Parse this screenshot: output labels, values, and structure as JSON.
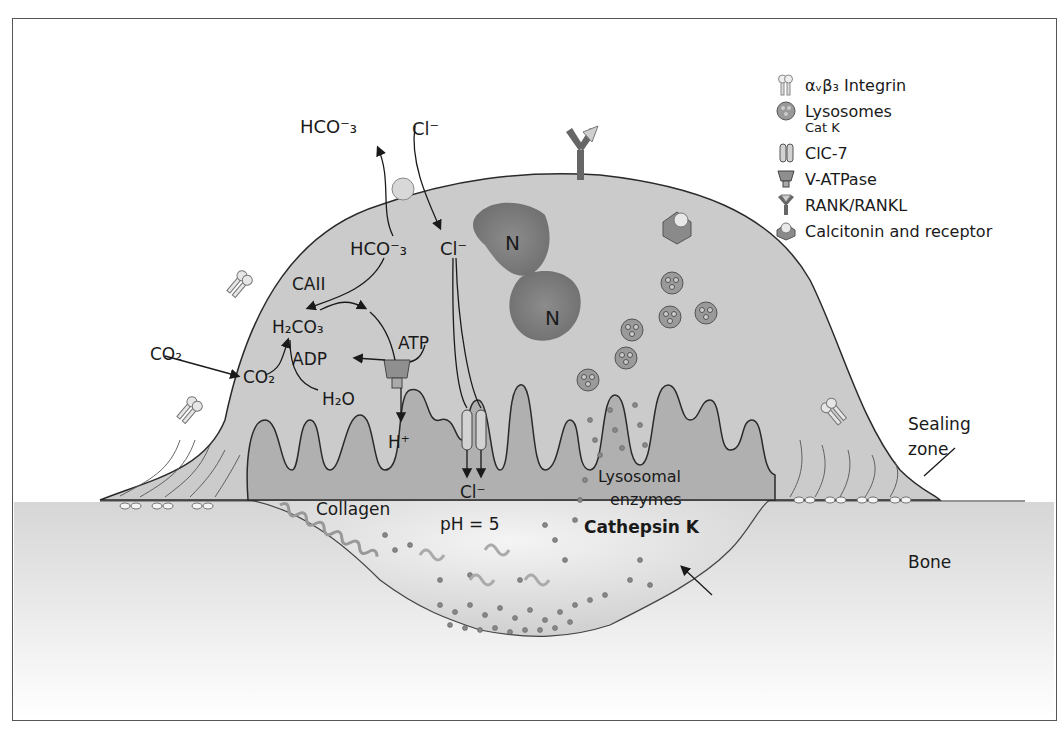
{
  "diagram": {
    "labels": {
      "hco3_out": "HCO⁻₃",
      "cl_out": "Cl⁻",
      "hco3_in": "HCO⁻₃",
      "cl_in": "Cl⁻",
      "caii": "CAII",
      "h2co3": "H₂CO₃",
      "co2_out": "CO₂",
      "co2_in": "CO₂",
      "adp": "ADP",
      "atp": "ATP",
      "h2o": "H₂O",
      "h_plus": "H⁺",
      "cl_bottom": "Cl⁻",
      "nucleus_1": "N",
      "nucleus_2": "N",
      "collagen": "Collagen",
      "ph": "pH = 5",
      "lysosomal_enzymes_line1": "Lysosomal",
      "lysosomal_enzymes_line2": "enzymes",
      "cathepsin_k": "Cathepsin K",
      "sealing_zone_line1": "Sealing",
      "sealing_zone_line2": "zone",
      "bone": "Bone"
    }
  },
  "legend": {
    "items": [
      {
        "icon": "integrin-icon",
        "label": "αᵥβ₃ Integrin"
      },
      {
        "icon": "lysosome-icon",
        "label": "Lysosomes",
        "sublabel": "Cat K"
      },
      {
        "icon": "clc7-channel-icon",
        "label": "ClC-7"
      },
      {
        "icon": "v-atpase-icon",
        "label": "V-ATPase"
      },
      {
        "icon": "rank-rankl-icon",
        "label": "RANK/RANKL"
      },
      {
        "icon": "calcitonin-receptor-icon",
        "label": "Calcitonin and receptor"
      }
    ]
  },
  "colors": {
    "cell_fill": "#c9c9c9",
    "cell_dark": "#a8a8a8",
    "nucleus": "#8a8a8a",
    "bone": "#e2e2e2",
    "outline": "#2a2a2a"
  }
}
